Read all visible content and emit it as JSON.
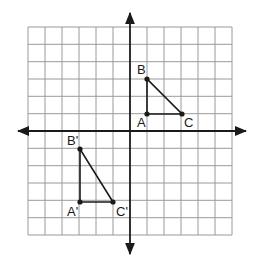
{
  "diagram": {
    "type": "coordinate-plane-reflection",
    "grid": {
      "columns": 12,
      "rows": 12,
      "x_range": [
        -6,
        6
      ],
      "y_range": [
        -6,
        6
      ],
      "line_color": "#9a9a9a"
    },
    "axes": {
      "color": "#1a1a1a",
      "arrows": true
    },
    "triangles": [
      {
        "name": "ABC",
        "vertices": [
          {
            "label": "A",
            "x": 1,
            "y": 1
          },
          {
            "label": "B",
            "x": 1,
            "y": 3
          },
          {
            "label": "C",
            "x": 3,
            "y": 1
          }
        ]
      },
      {
        "name": "A'B'C'",
        "vertices": [
          {
            "label": "A'",
            "x": -3,
            "y": -4
          },
          {
            "label": "B'",
            "x": -3,
            "y": -1
          },
          {
            "label": "C'",
            "x": -1,
            "y": -4
          }
        ]
      }
    ]
  },
  "labels": {
    "A": "A",
    "B": "B",
    "C": "C",
    "A_prime": "A'",
    "B_prime": "B'",
    "C_prime": "C'"
  }
}
